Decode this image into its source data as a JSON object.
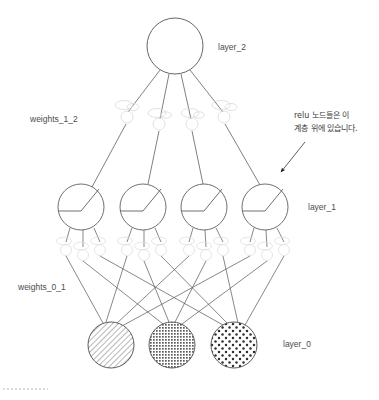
{
  "diagram": {
    "background_color": "#ffffff",
    "stroke_color": "#555555",
    "faint_stroke_color": "#d8d8d8",
    "label_color": "#4c4c4c",
    "labels": {
      "layer_2": "layer_2",
      "weights_1_2": "weights_1_2",
      "layer_1": "layer_1",
      "weights_0_1": "weights_0_1",
      "layer_0": "layer_0"
    },
    "annotation": {
      "line_1": "relu 노드들은 이",
      "line_2": "계층 위에 있습니다.",
      "arrow": "arrow-pointing-down-left"
    },
    "layers": [
      {
        "name": "layer_2",
        "kind": "output",
        "node_count": 1,
        "node_radius": 28,
        "nodes": [
          {
            "cx": 175,
            "cy": 46,
            "fill": "none",
            "glyph": "plain"
          }
        ]
      },
      {
        "name": "weights_1_2",
        "kind": "weights",
        "node_count": 4,
        "node_radius": 6,
        "nodes": [
          {
            "cx": 127,
            "cy": 117,
            "fill": "none",
            "glyph": "faint-weight"
          },
          {
            "cx": 159,
            "cy": 124,
            "fill": "none",
            "glyph": "faint-weight"
          },
          {
            "cx": 192,
            "cy": 124,
            "fill": "none",
            "glyph": "faint-weight"
          },
          {
            "cx": 224,
            "cy": 117,
            "fill": "none",
            "glyph": "faint-weight"
          }
        ]
      },
      {
        "name": "layer_1",
        "kind": "hidden",
        "node_count": 4,
        "node_radius": 23,
        "glyph": "relu",
        "nodes": [
          {
            "cx": 81,
            "cy": 207,
            "fill": "none",
            "glyph": "relu"
          },
          {
            "cx": 143,
            "cy": 207,
            "fill": "none",
            "glyph": "relu"
          },
          {
            "cx": 204,
            "cy": 207,
            "fill": "none",
            "glyph": "relu"
          },
          {
            "cx": 265,
            "cy": 207,
            "fill": "none",
            "glyph": "relu"
          }
        ]
      },
      {
        "name": "weights_0_1",
        "kind": "weights",
        "node_count": 12,
        "node_radius": 5,
        "nodes": [
          {
            "cx": 66,
            "cy": 247,
            "glyph": "faint-weight"
          },
          {
            "cx": 83,
            "cy": 252,
            "glyph": "faint-weight"
          },
          {
            "cx": 100,
            "cy": 247,
            "glyph": "faint-weight"
          },
          {
            "cx": 127,
            "cy": 247,
            "glyph": "faint-weight"
          },
          {
            "cx": 144,
            "cy": 252,
            "glyph": "faint-weight"
          },
          {
            "cx": 161,
            "cy": 247,
            "glyph": "faint-weight"
          },
          {
            "cx": 189,
            "cy": 247,
            "glyph": "faint-weight"
          },
          {
            "cx": 206,
            "cy": 252,
            "glyph": "faint-weight"
          },
          {
            "cx": 223,
            "cy": 247,
            "glyph": "faint-weight"
          },
          {
            "cx": 250,
            "cy": 247,
            "glyph": "faint-weight"
          },
          {
            "cx": 267,
            "cy": 252,
            "glyph": "faint-weight"
          },
          {
            "cx": 284,
            "cy": 247,
            "glyph": "faint-weight"
          }
        ]
      },
      {
        "name": "layer_0",
        "kind": "input",
        "node_count": 3,
        "node_radius": 23,
        "nodes": [
          {
            "cx": 111,
            "cy": 345,
            "fill": "pattern-diagonal-hatch",
            "pattern_color": "#9a9a9a"
          },
          {
            "cx": 172,
            "cy": 345,
            "fill": "pattern-dense-crosshatch",
            "pattern_color": "#5d5d5d"
          },
          {
            "cx": 234,
            "cy": 345,
            "fill": "pattern-polka-dots",
            "pattern_color": "#303030"
          }
        ]
      }
    ],
    "label_positions": {
      "layer_2": {
        "x": 218,
        "y": 50
      },
      "weights_1_2": {
        "x": 30,
        "y": 122
      },
      "layer_1": {
        "x": 308,
        "y": 210
      },
      "weights_0_1": {
        "x": 18,
        "y": 290
      },
      "layer_0": {
        "x": 283,
        "y": 347
      }
    },
    "annotation_position": {
      "x": 292,
      "y": 118,
      "line_height": 13
    },
    "footer_dotted_line": {
      "x1": 3,
      "y1": 389,
      "x2": 48,
      "y2": 389,
      "color": "#cfcfcf"
    }
  }
}
